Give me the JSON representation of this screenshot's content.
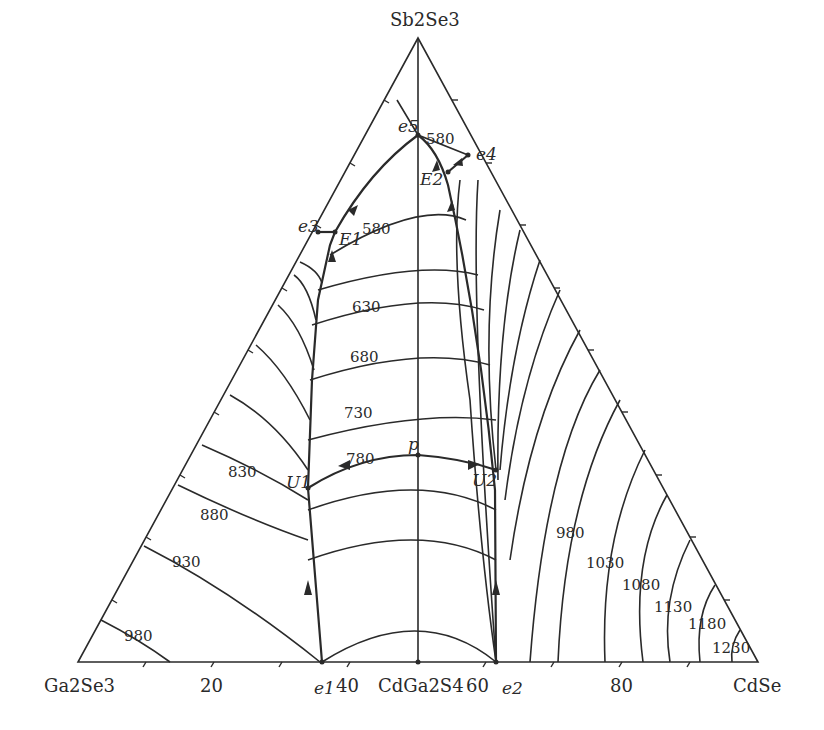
{
  "diagram": {
    "type": "ternary-liquidus-projection",
    "vertices": {
      "top": "Sb2Se3",
      "left": "Ga2Se3",
      "right": "CdSe"
    },
    "base_axis": {
      "ticks": [
        "20",
        "40",
        "60",
        "80"
      ],
      "mid_compound": "CdGa2S4"
    },
    "invariant_points": [
      "e1",
      "e2",
      "e3",
      "e4",
      "e5",
      "E1",
      "E2",
      "U1",
      "U2",
      "p"
    ],
    "isotherms_left_field": [
      "980",
      "930",
      "880",
      "830"
    ],
    "isotherms_center_field": [
      "580",
      "630",
      "680",
      "730",
      "780"
    ],
    "isotherms_top_field": [
      "580"
    ],
    "isotherms_right_field": [
      "980",
      "1030",
      "1080",
      "1130",
      "1180",
      "1230"
    ]
  }
}
